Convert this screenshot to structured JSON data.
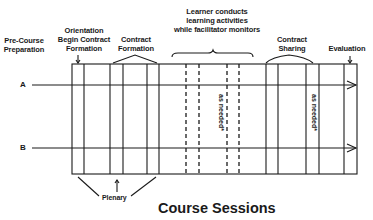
{
  "diagram": {
    "title": "Course Sessions",
    "phases": {
      "pre_course": [
        "Pre-Course",
        "Preparation"
      ],
      "orientation": [
        "Orientation",
        "Begin Contract",
        "Formation"
      ],
      "contract_formation": [
        "Contract",
        "Formation"
      ],
      "learner": [
        "Learner conducts",
        "learning activities",
        "while facilitator monitors"
      ],
      "contract_sharing": [
        "Contract",
        "Sharing"
      ],
      "evaluation": "Evaluation"
    },
    "tracks": [
      {
        "label": "A"
      },
      {
        "label": "B"
      }
    ],
    "annotations": {
      "as_needed_1": "as needed*",
      "as_needed_2": "as needed*",
      "plenary": "Plenary"
    },
    "colors": {
      "line": "#1a1a1a",
      "background": "#ffffff"
    }
  }
}
